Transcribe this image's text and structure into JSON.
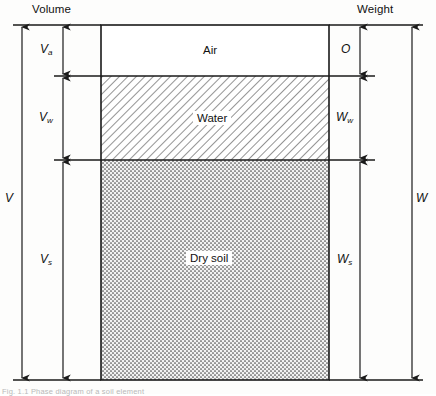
{
  "figure": {
    "headers": {
      "volume": "Volume",
      "weight": "Weight"
    },
    "phases": [
      {
        "key": "air",
        "label": "Air",
        "fill": "none"
      },
      {
        "key": "water",
        "label": "Water",
        "fill": "diagonal-hatch"
      },
      {
        "key": "soil",
        "label": "Dry soil",
        "fill": "dotted-stipple"
      }
    ],
    "volume_dimensions": [
      {
        "name": "V_a",
        "base": "V",
        "sub": "a",
        "meaning": "volume of air"
      },
      {
        "name": "V_w",
        "base": "V",
        "sub": "w",
        "meaning": "volume of water"
      },
      {
        "name": "V_s",
        "base": "V",
        "sub": "s",
        "meaning": "volume of solids"
      },
      {
        "name": "V",
        "base": "V",
        "sub": "",
        "meaning": "total volume"
      }
    ],
    "weight_dimensions": [
      {
        "name": "O",
        "base": "O",
        "sub": "",
        "meaning": "weight of air (zero)"
      },
      {
        "name": "W_w",
        "base": "W",
        "sub": "w",
        "meaning": "weight of water"
      },
      {
        "name": "W_s",
        "base": "W",
        "sub": "s",
        "meaning": "weight of solids"
      },
      {
        "name": "W",
        "base": "W",
        "sub": "",
        "meaning": "total weight"
      }
    ],
    "caption": "Fig. 1.1  Phase diagram of a soil element",
    "colors": {
      "line": "#1a1a1a",
      "background": "#ffffff",
      "hatch": "#3a3a3a",
      "stipple": "#4a4a4a"
    }
  }
}
